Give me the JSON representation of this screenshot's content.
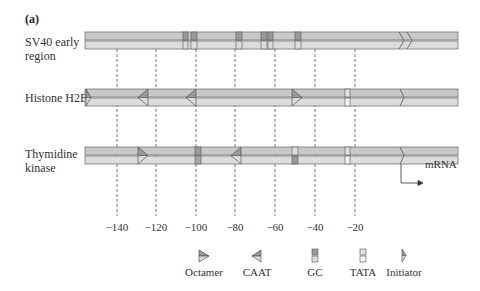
{
  "figure": {
    "panel_label": "(a)",
    "rows": [
      {
        "label_lines": [
          "SV40 early",
          "region"
        ]
      },
      {
        "label_lines": [
          "Histone H2B"
        ]
      },
      {
        "label_lines": [
          "Thymidine",
          "kinase"
        ]
      }
    ],
    "axis": {
      "ticks": [
        "−140",
        "−120",
        "−100",
        "−80",
        "−60",
        "−40",
        "−20"
      ]
    },
    "mrna_label": "mRNA",
    "legend": [
      {
        "label": "Octamer",
        "icon": "octamer-icon"
      },
      {
        "label": "CAAT",
        "icon": "caat-icon"
      },
      {
        "label": "GC",
        "icon": "gc-box-icon"
      },
      {
        "label": "TATA",
        "icon": "tata-box-icon"
      },
      {
        "label": "Initiator",
        "icon": "initiator-icon"
      }
    ],
    "colors": {
      "bar_top": "#c8c8c8",
      "bar_bottom": "#dcdcdc",
      "element_dark": "#9a9a9a",
      "element_light": "#e8e8e8",
      "outline": "#666666"
    }
  }
}
